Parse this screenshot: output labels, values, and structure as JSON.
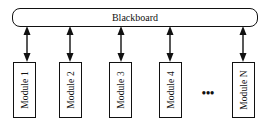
{
  "diagram": {
    "blackboard": {
      "label": "Blackboard"
    },
    "modules": [
      {
        "label": "Module 1",
        "x": 13,
        "arrow_x": 27
      },
      {
        "label": "Module 2",
        "x": 60,
        "arrow_x": 70
      },
      {
        "label": "Module 3",
        "x": 109,
        "arrow_x": 121
      },
      {
        "label": "Module 4",
        "x": 160,
        "arrow_x": 170
      },
      {
        "label": "Module N",
        "x": 232,
        "arrow_x": 243
      }
    ],
    "ellipsis": "•••",
    "connections": "bidirectional",
    "colors": {
      "stroke": "#111111",
      "background": "#ffffff"
    }
  }
}
